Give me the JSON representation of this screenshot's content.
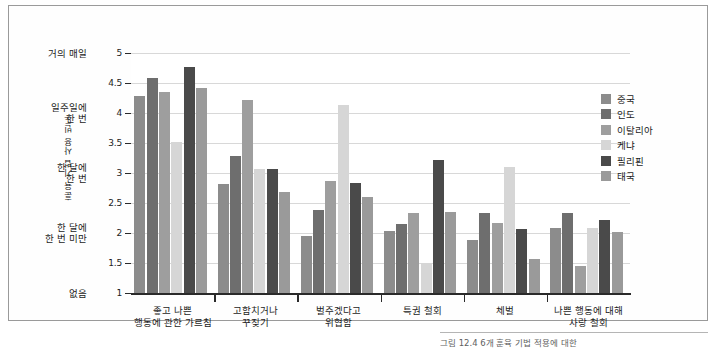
{
  "figure": {
    "caption": "그림 12.4 6개 훈육 기법 적용에 대한"
  },
  "chart_data": {
    "type": "bar",
    "title": "",
    "xlabel": "",
    "ylabel": "훈육 기법 사용 빈도",
    "ylim": [
      1,
      5
    ],
    "yticks": [
      1,
      1.5,
      2,
      2.5,
      3,
      3.5,
      4,
      4.5,
      5
    ],
    "ytick_labels": [
      "1",
      "1.5",
      "2",
      "2.5",
      "3",
      "3.5",
      "4",
      "4.5",
      "5"
    ],
    "y_category_labels": [
      {
        "value": 5,
        "label": "거의 매일"
      },
      {
        "value": 4,
        "label": "일주일에\n한 번"
      },
      {
        "value": 3,
        "label": "한 달에\n한 번"
      },
      {
        "value": 2,
        "label": "한 달에\n한 번 미만"
      },
      {
        "value": 1,
        "label": "없음"
      }
    ],
    "grid": true,
    "legend_position": "right",
    "categories": [
      "좋고 나쁜\n행동에 관한 가르침",
      "고함치거나\n꾸짖기",
      "벌주겠다고\n위협함",
      "특권 철회",
      "체벌",
      "나쁜 행동에 대해\n사랑 철회"
    ],
    "series": [
      {
        "name": "중국",
        "color": "#8c8c8c",
        "values": [
          4.28,
          2.81,
          1.95,
          2.03,
          1.89,
          2.09
        ]
      },
      {
        "name": "인도",
        "color": "#6e6e6e",
        "values": [
          4.59,
          3.29,
          2.39,
          2.15,
          2.34,
          2.34
        ]
      },
      {
        "name": "이탈리아",
        "color": "#9e9e9e",
        "values": [
          4.35,
          4.21,
          2.86,
          2.34,
          2.17,
          1.45
        ]
      },
      {
        "name": "케냐",
        "color": "#d6d6d6",
        "values": [
          3.51,
          3.06,
          4.13,
          1.5,
          3.1,
          2.08
        ]
      },
      {
        "name": "필리핀",
        "color": "#4a4a4a",
        "values": [
          4.77,
          3.06,
          2.83,
          3.22,
          2.06,
          2.21
        ]
      },
      {
        "name": "태국",
        "color": "#9a9a9a",
        "values": [
          4.42,
          2.69,
          2.6,
          2.35,
          1.56,
          2.01
        ]
      }
    ]
  }
}
